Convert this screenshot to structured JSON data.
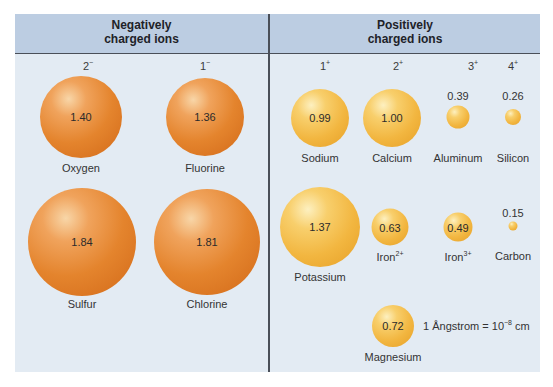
{
  "headers": {
    "negative": [
      "Negatively",
      "charged ions"
    ],
    "positive": [
      "Positively",
      "charged ions"
    ]
  },
  "charges": {
    "neg2": {
      "num": "2",
      "sign": "−"
    },
    "neg1": {
      "num": "1",
      "sign": "−"
    },
    "pos1": {
      "num": "1",
      "sign": "+"
    },
    "pos2": {
      "num": "2",
      "sign": "+"
    },
    "pos3": {
      "num": "3",
      "sign": "+"
    },
    "pos4": {
      "num": "4",
      "sign": "+"
    }
  },
  "ions": {
    "oxygen": {
      "name": "Oxygen",
      "radius": "1.40"
    },
    "fluorine": {
      "name": "Fluorine",
      "radius": "1.36"
    },
    "sulfur": {
      "name": "Sulfur",
      "radius": "1.84"
    },
    "chlorine": {
      "name": "Chlorine",
      "radius": "1.81"
    },
    "sodium": {
      "name": "Sodium",
      "radius": "0.99"
    },
    "calcium": {
      "name": "Calcium",
      "radius": "1.00"
    },
    "aluminum": {
      "name": "Aluminum",
      "radius": "0.39"
    },
    "silicon": {
      "name": "Silicon",
      "radius": "0.26"
    },
    "potassium": {
      "name": "Potassium",
      "radius": "1.37"
    },
    "iron2": {
      "name": "Iron",
      "sup": "2+",
      "radius": "0.63"
    },
    "iron3": {
      "name": "Iron",
      "sup": "3+",
      "radius": "0.49"
    },
    "carbon": {
      "name": "Carbon",
      "radius": "0.15"
    },
    "magnesium": {
      "name": "Magnesium",
      "radius": "0.72"
    }
  },
  "note": {
    "text": "1 Ångstrom = 10",
    "exp": "−8",
    "unit": " cm"
  },
  "colors": {
    "header_bg": "#bccde2",
    "panel_bg": "#e3ebf3",
    "negative_ion": "#e4842d",
    "positive_ion": "#f2b640",
    "divider": "#4a4f58"
  }
}
